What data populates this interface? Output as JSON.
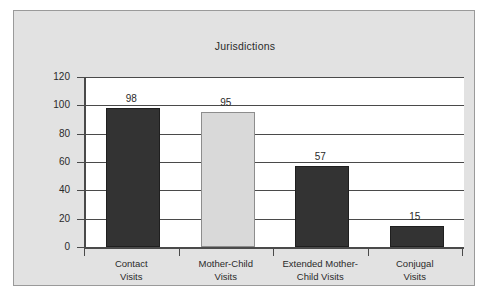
{
  "figure": {
    "background_color": "#ffffff",
    "frame_background_color": "#e2e2e2",
    "frame_border_color": "#9a9a9a",
    "plot_background_color": "#ffffff",
    "axis_color": "#4a4a4a"
  },
  "chart_data": {
    "type": "bar",
    "title": "Jurisdictions",
    "xlabel": "",
    "ylabel": "",
    "ylim": [
      0,
      120
    ],
    "yticks": [
      0,
      20,
      40,
      60,
      80,
      100,
      120
    ],
    "grid": true,
    "legend": null,
    "categories": [
      "Contact\nVisits",
      "Mother-Child\nVisits",
      "Extended Mother-\nChild Visits",
      "Conjugal\nVisits"
    ],
    "values": [
      98,
      95,
      57,
      15
    ],
    "value_labels": [
      "98",
      "95",
      "57",
      "15"
    ],
    "bar_colors": [
      "#333333",
      "#d9d9d9",
      "#333333",
      "#333333"
    ],
    "bar_border_colors": [
      "#1f1f1f",
      "#8d8d8d",
      "#1f1f1f",
      "#1f1f1f"
    ]
  },
  "axis": {
    "tick_labels": [
      "120",
      "100",
      "80",
      "60",
      "40",
      "20",
      "0"
    ]
  }
}
